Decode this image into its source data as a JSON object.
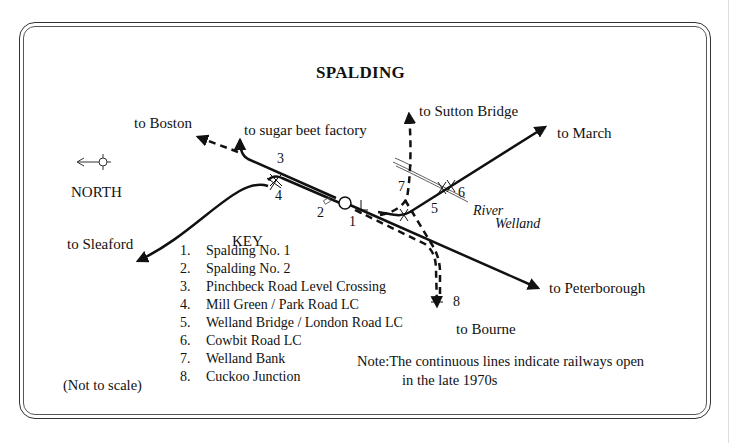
{
  "title": "SPALDING",
  "compass": {
    "label": "NORTH",
    "icon": "north-arrow-left"
  },
  "destinations": {
    "boston": "to Boston",
    "sugar_beet": "to sugar beet factory",
    "sutton_bridge": "to Sutton Bridge",
    "march": "to March",
    "sleaford": "to Sleaford",
    "peterborough": "to Peterborough",
    "bourne": "to Bourne"
  },
  "river": {
    "line1": "River",
    "line2": "Welland"
  },
  "markers": [
    "1",
    "2",
    "3",
    "4",
    "5",
    "6",
    "7",
    "8"
  ],
  "key": {
    "title": "KEY",
    "items": [
      {
        "n": "1.",
        "label": "Spalding No. 1"
      },
      {
        "n": "2.",
        "label": "Spalding No. 2"
      },
      {
        "n": "3.",
        "label": "Pinchbeck Road Level Crossing"
      },
      {
        "n": "4.",
        "label": "Mill Green / Park Road LC"
      },
      {
        "n": "5.",
        "label": "Welland Bridge / London Road LC"
      },
      {
        "n": "6.",
        "label": "Cowbit Road LC"
      },
      {
        "n": "7.",
        "label": "Welland Bank"
      },
      {
        "n": "8.",
        "label": "Cuckoo Junction"
      }
    ]
  },
  "scale_note": "(Not to scale)",
  "note": {
    "line1": "Note:The continuous lines indicate railways open",
    "line2": "in the late 1970s"
  },
  "colors": {
    "line": "#111111",
    "background": "#ffffff",
    "frame": "#333333"
  }
}
